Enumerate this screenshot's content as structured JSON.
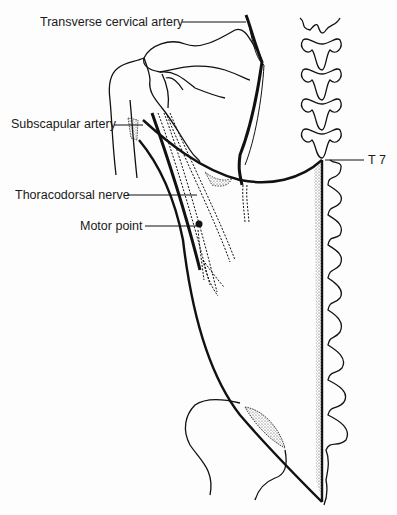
{
  "labels": {
    "transverse_cervical_artery": "Transverse cervical artery",
    "subscapular_artery": "Subscapular artery",
    "thoracodorsal_nerve": "Thoracodorsal nerve",
    "motor_point": "Motor point",
    "t7": "T 7"
  },
  "colors": {
    "ink": "#111111",
    "background": "#fdfdfd",
    "stipple": "#555555"
  }
}
